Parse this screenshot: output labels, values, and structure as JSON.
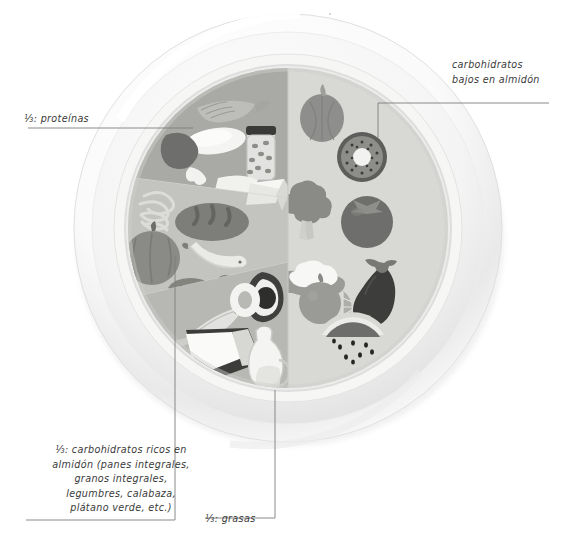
{
  "figure": {
    "type": "plate-diagram",
    "background_color": "#ffffff",
    "line_color": "#6b6b6b"
  },
  "labels": {
    "proteinas": {
      "text": "⅓: proteínas",
      "section": "proteins",
      "leader": "horizontal-right"
    },
    "carbs_bajos": {
      "text": "carbohidratos\nbajos en almidón",
      "section": "low-starch-carbs",
      "leader": "left-then-down"
    },
    "carbs_ricos": {
      "text": "⅓: carbohidratos ricos en\nalmidón (panes integrales,\ngranos integrales,\nlegumbres, calabaza,\nplátano verde, etc.)",
      "section": "starchy-carbs",
      "leader": "vertical-up"
    },
    "grasas": {
      "text": "⅓: grasas",
      "section": "fats",
      "leader": "vertical-up"
    }
  },
  "plate": {
    "center_x": 288,
    "center_y": 228,
    "outer_radius": 216,
    "rim_color": "#f3f3f3",
    "rim_shadow": "#d9d9d9",
    "inner_radius": 160,
    "sections": [
      {
        "name": "low-starch-carbs",
        "label": "carbohidratos bajos en almidón",
        "fill": "#d5d5d2",
        "fraction": "1/2",
        "items": [
          "onion",
          "kiwi",
          "broccoli",
          "tomato",
          "cauliflower",
          "orange",
          "orange-slice",
          "eggplant",
          "watermelon"
        ]
      },
      {
        "name": "proteins",
        "label": "⅓: proteínas",
        "fill": "#a8a8a6",
        "fraction": "1/3",
        "items": [
          "fish",
          "egg",
          "bean-jar",
          "chicken-drumstick",
          "cheese-wedge",
          "meat-steak"
        ]
      },
      {
        "name": "starchy-carbs",
        "label": "⅓: carbohidratos ricos en almidón",
        "fill": "#c2c2bf",
        "fraction": "1/3",
        "items": [
          "pasta",
          "bread-loaf",
          "cheese-block",
          "pumpkin",
          "banana",
          "pea-pod"
        ]
      },
      {
        "name": "fats",
        "label": "⅓: grasas",
        "fill": "#b6b6b3",
        "fraction": "1/3",
        "items": [
          "avocado",
          "sardine",
          "butter",
          "oil-cruet",
          "nut"
        ]
      }
    ]
  }
}
